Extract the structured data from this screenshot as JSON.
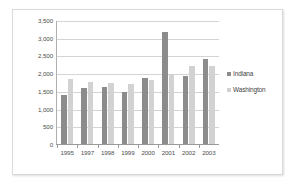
{
  "chart_data": {
    "type": "bar",
    "title": "",
    "subtitle": "",
    "xlabel": "",
    "ylabel": "",
    "categories": [
      "1995",
      "1997",
      "1998",
      "1999",
      "2000",
      "2001",
      "2002",
      "2003"
    ],
    "series": [
      {
        "name": "Indiana",
        "color": "#8c8c8c",
        "values": [
          1410,
          1610,
          1640,
          1500,
          1900,
          3180,
          1950,
          2420
        ]
      },
      {
        "name": "Washington",
        "color": "#d2d2d2",
        "values": [
          1870,
          1790,
          1750,
          1720,
          1840,
          2000,
          2230,
          2240
        ]
      }
    ],
    "ylim": [
      0,
      3500
    ],
    "ytick_step": 500,
    "ytick_labels": [
      "3,500",
      "3,000",
      "2,500",
      "2,000",
      "1,500",
      "1,000",
      "500",
      "0"
    ],
    "ytick_values": [
      3500,
      3000,
      2500,
      2000,
      1500,
      1000,
      500,
      0
    ],
    "grid": true,
    "legend_position": "right"
  }
}
